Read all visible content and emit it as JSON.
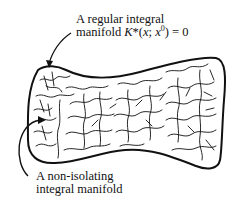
{
  "figure": {
    "type": "diagram",
    "labels": {
      "regular": {
        "line1": "A regular integral",
        "line2_prefix": "manifold ",
        "symbol": "K",
        "star": "*",
        "args_open": "(",
        "arg_x": "x",
        "sep": "; ",
        "arg_x0": "x",
        "arg_x0_sup": "0",
        "args_close": ")",
        "equals": " = 0"
      },
      "non_isolating": {
        "line1": "A non-isolating",
        "line2": "integral manifold"
      }
    },
    "colors": {
      "ink": "#111111",
      "background": "#ffffff"
    }
  }
}
